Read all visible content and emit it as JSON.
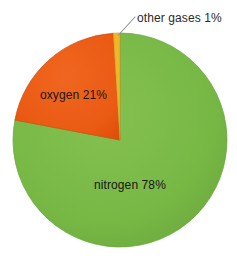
{
  "chart_data": {
    "type": "pie",
    "title": "Composition of air",
    "categories": [
      "nitrogen",
      "oxygen",
      "other gases"
    ],
    "values": [
      78,
      21,
      1
    ],
    "unit": "%",
    "labels": [
      "nitrogen 78%",
      "oxygen 21%",
      "other gases 1%"
    ],
    "colors": [
      "#77b845",
      "#ea5a13",
      "#f2b42a"
    ],
    "legend": "none",
    "grid": false,
    "start_angle_deg": 0,
    "direction": "clockwise",
    "slice_order": [
      "nitrogen",
      "oxygen",
      "other gases"
    ],
    "annotations": [
      {
        "text": "other gases 1%",
        "kind": "callout-with-leader-line",
        "target_slice": "other gases"
      }
    ],
    "xlabel": "",
    "ylabel": ""
  },
  "geometry": {
    "center_x": 120,
    "center_y": 140,
    "radius": 107
  },
  "labels": {
    "nitrogen": "nitrogen 78%",
    "oxygen": "oxygen 21%",
    "other_gases": "other gases 1%"
  },
  "colors": {
    "nitrogen_green": "#77b845",
    "oxygen_orange": "#ea5a13",
    "other_gases_yellow": "#f2b42a",
    "slice_outline": "#5f9636",
    "leader_line": "#8a8a8a",
    "label_text": "#161616",
    "background": "#ffffff"
  }
}
